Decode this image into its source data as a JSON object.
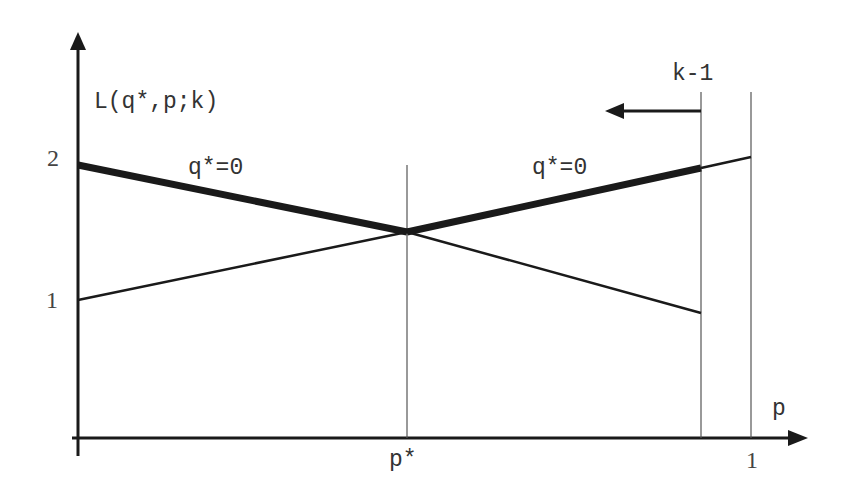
{
  "diagram": {
    "y_axis_label": "L(q*,p;k)",
    "x_axis_label": "p",
    "y_ticks": [
      {
        "label": "2",
        "value": 2
      },
      {
        "label": "1",
        "value": 1
      }
    ],
    "x_ticks": [
      {
        "label": "p*",
        "value": "p*"
      },
      {
        "label": "1",
        "value": 1
      }
    ],
    "vertical_marker_label": "k-1",
    "segment_labels": {
      "left": "q*=0",
      "right": "q*=0"
    },
    "arrow_direction": "left",
    "colors": {
      "lines": "#1a1a1a",
      "thin_lines": "#555555",
      "text": "#333333",
      "background": "#ffffff"
    }
  }
}
